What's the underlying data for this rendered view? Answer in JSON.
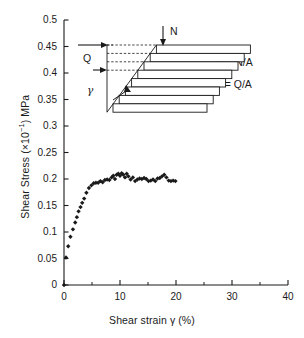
{
  "chart_data": {
    "type": "scatter",
    "title": "",
    "xlabel": "Shear strain γ (%)",
    "ylabel": "Shear Stress (×10⁻¹) MPa",
    "xlim": [
      0,
      40
    ],
    "ylim": [
      0,
      0.5
    ],
    "grid": false,
    "legend": null,
    "x_major_ticks": [
      0,
      10,
      20,
      30,
      40
    ],
    "x_minor_ticks": [
      5,
      15,
      25,
      35
    ],
    "x_tick_labels": [
      "0",
      "10",
      "20",
      "30",
      "40"
    ],
    "y_major_ticks": [
      0,
      0.05,
      0.1,
      0.15,
      0.2,
      0.25,
      0.3,
      0.35,
      0.4,
      0.45,
      0.5
    ],
    "y_tick_labels": [
      "0",
      "0.05",
      "0.1",
      "0.15",
      "0.2",
      "0.25",
      "0.3",
      "0.35",
      "0.4",
      "0.45",
      "0.5"
    ],
    "marker": "diamond",
    "marker_color": "#1a1a1a",
    "series": [
      {
        "name": "Shear stress vs shear strain",
        "points": [
          [
            0.0,
            0.0
          ],
          [
            0.35,
            0.052
          ],
          [
            0.75,
            0.073
          ],
          [
            1.15,
            0.091
          ],
          [
            1.6,
            0.105
          ],
          [
            2.0,
            0.118
          ],
          [
            2.3,
            0.128
          ],
          [
            2.6,
            0.139
          ],
          [
            2.95,
            0.147
          ],
          [
            3.25,
            0.155
          ],
          [
            3.6,
            0.163
          ],
          [
            4.0,
            0.174
          ],
          [
            4.45,
            0.183
          ],
          [
            4.9,
            0.188
          ],
          [
            5.3,
            0.192
          ],
          [
            5.7,
            0.193
          ],
          [
            6.1,
            0.193
          ],
          [
            6.5,
            0.196
          ],
          [
            6.9,
            0.194
          ],
          [
            7.3,
            0.198
          ],
          [
            7.7,
            0.199
          ],
          [
            8.1,
            0.198
          ],
          [
            8.5,
            0.203
          ],
          [
            8.8,
            0.206
          ],
          [
            9.1,
            0.2
          ],
          [
            9.4,
            0.208
          ],
          [
            9.7,
            0.21
          ],
          [
            10.0,
            0.206
          ],
          [
            10.3,
            0.211
          ],
          [
            10.6,
            0.208
          ],
          [
            10.9,
            0.203
          ],
          [
            11.2,
            0.21
          ],
          [
            11.5,
            0.205
          ],
          [
            11.9,
            0.199
          ],
          [
            12.3,
            0.203
          ],
          [
            12.7,
            0.196
          ],
          [
            13.1,
            0.199
          ],
          [
            13.5,
            0.201
          ],
          [
            13.9,
            0.2
          ],
          [
            14.3,
            0.202
          ],
          [
            14.7,
            0.2
          ],
          [
            15.1,
            0.196
          ],
          [
            15.5,
            0.197
          ],
          [
            15.9,
            0.199
          ],
          [
            16.3,
            0.196
          ],
          [
            16.7,
            0.201
          ],
          [
            17.1,
            0.202
          ],
          [
            17.5,
            0.205
          ],
          [
            17.9,
            0.208
          ],
          [
            18.3,
            0.203
          ],
          [
            18.7,
            0.197
          ],
          [
            19.1,
            0.196
          ],
          [
            19.5,
            0.197
          ],
          [
            19.9,
            0.196
          ]
        ]
      }
    ],
    "annotations": {
      "inset_title": "",
      "load_normal_label": "N",
      "load_shear_label": "Q",
      "angle_label": "γ",
      "equation_normal": "σ = N/A",
      "equation_shear": "τ = Q/A"
    }
  },
  "axis": {
    "y_label_prefix": "Shear Stress (×10",
    "y_label_exponent": "−1",
    "y_label_suffix": ") MPa",
    "x_label": "Shear strain γ (%)"
  }
}
